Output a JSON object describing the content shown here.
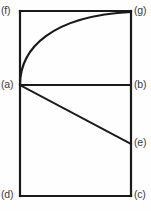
{
  "figure": {
    "background_color": "#fefefe",
    "stroke_color": "#1a1a1a",
    "label_color": "#3a3a3a",
    "labels": {
      "f": "(f)",
      "g": "(g)",
      "a": "(a)",
      "b": "(b)",
      "e": "(e)",
      "d": "(d)",
      "c": "(c)"
    },
    "points": {
      "f": {
        "x": 20,
        "y": 11,
        "desc": "top-left corner"
      },
      "g": {
        "x": 131,
        "y": 11,
        "desc": "top-right corner"
      },
      "a": {
        "x": 20,
        "y": 85,
        "desc": "vertex on left edge"
      },
      "b": {
        "x": 131,
        "y": 85,
        "desc": "right edge, horizontal from a"
      },
      "e": {
        "x": 131,
        "y": 144,
        "desc": "right edge, descending line from a"
      },
      "d": {
        "x": 20,
        "y": 196,
        "desc": "bottom-left corner"
      },
      "c": {
        "x": 131,
        "y": 196,
        "desc": "bottom-right corner"
      }
    },
    "edges": [
      {
        "name": "rectangle-top",
        "from": "f",
        "to": "g",
        "kind": "straight"
      },
      {
        "name": "rectangle-right",
        "from": "g",
        "to": "c",
        "kind": "straight"
      },
      {
        "name": "rectangle-bottom",
        "from": "c",
        "to": "d",
        "kind": "straight"
      },
      {
        "name": "rectangle-left",
        "from": "d",
        "to": "f",
        "kind": "straight"
      },
      {
        "name": "horizontal-chord-ab",
        "from": "a",
        "to": "b",
        "kind": "straight"
      },
      {
        "name": "descending-chord-ae",
        "from": "a",
        "to": "e",
        "kind": "straight"
      },
      {
        "name": "concave-curve-ag",
        "from": "a",
        "to": "g",
        "kind": "curve"
      }
    ],
    "curve_path": "M 20 85 C 20 48, 52 16, 131 12",
    "line_width": "2"
  }
}
